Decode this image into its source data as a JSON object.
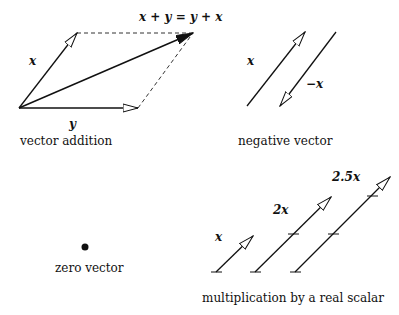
{
  "panels": {
    "vector_addition": {
      "caption": "vector addition",
      "label_x": "x",
      "label_y": "y",
      "label_sum": "x + y = y + x"
    },
    "negative_vector": {
      "caption": "negative vector",
      "label_x": "x",
      "label_neg_x": "−x"
    },
    "zero_vector": {
      "caption": "zero vector"
    },
    "scalar_multiplication": {
      "caption": "multiplication by a real scalar",
      "label_1x": "x",
      "label_2x": "2x",
      "label_25x": "2.5x"
    }
  },
  "colors": {
    "line": "#111111",
    "dashed": "#333333",
    "background": "#ffffff"
  }
}
